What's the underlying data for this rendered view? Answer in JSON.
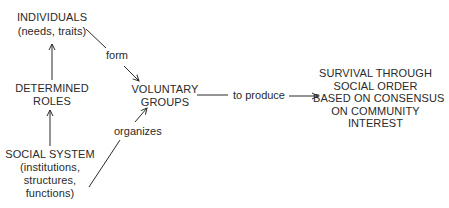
{
  "diagram": {
    "type": "concept-flow",
    "nodes": {
      "individuals": {
        "title": "INDIVIDUALS",
        "subtitle": "(needs, traits)"
      },
      "determined_roles": {
        "line1": "DETERMINED",
        "line2": "ROLES"
      },
      "social_system": {
        "title": "SOCIAL SYSTEM",
        "line2": "(institutions,",
        "line3": "structures,",
        "line4": "functions)"
      },
      "voluntary_groups": {
        "line1": "VOLUNTARY",
        "line2": "GROUPS"
      },
      "outcome": {
        "line1": "SURVIVAL THROUGH",
        "line2": "SOCIAL ORDER",
        "line3": "BASED ON CONSENSUS",
        "line4": "ON COMMUNITY",
        "line5": "INTEREST"
      }
    },
    "edge_labels": {
      "form": "form",
      "organizes": "organizes",
      "to_produce": "to produce"
    },
    "edges": [
      {
        "from": "determined_roles",
        "to": "individuals",
        "label": ""
      },
      {
        "from": "social_system",
        "to": "determined_roles",
        "label": ""
      },
      {
        "from": "individuals",
        "to": "voluntary_groups",
        "label": "form"
      },
      {
        "from": "social_system",
        "to": "voluntary_groups",
        "label": "organizes"
      },
      {
        "from": "voluntary_groups",
        "to": "outcome",
        "label": "to produce"
      }
    ],
    "colors": {
      "ink": "#2a2a2a",
      "background": "#ffffff"
    }
  }
}
